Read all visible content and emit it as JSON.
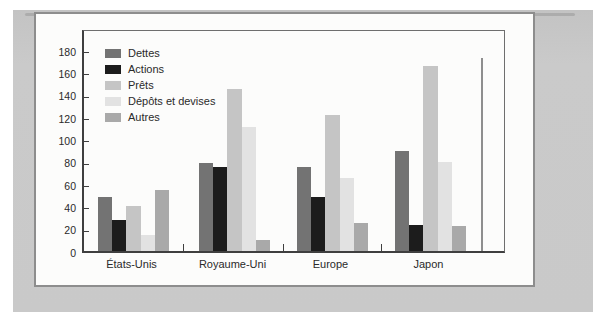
{
  "figure": {
    "unit_label": "%"
  },
  "chart_data": {
    "type": "bar",
    "title": "",
    "unit_label": "%",
    "categories": [
      "États-Unis",
      "Royaume-Uni",
      "Europe",
      "Japon"
    ],
    "series": [
      {
        "name": "Dettes",
        "color": "#737373",
        "values": [
          48,
          79,
          75,
          90
        ]
      },
      {
        "name": "Actions",
        "color": "#1c1c1c",
        "values": [
          28,
          75,
          48,
          23
        ]
      },
      {
        "name": "Prêts",
        "color": "#c5c5c5",
        "values": [
          40,
          145,
          122,
          166
        ]
      },
      {
        "name": "Dépôts et devises",
        "color": "#e2e2e2",
        "values": [
          14,
          111,
          65,
          80
        ]
      },
      {
        "name": "Autres",
        "color": "#a9a9a9",
        "values": [
          55,
          10,
          25,
          22
        ]
      }
    ],
    "ylabel": "%",
    "xlabel": "",
    "ylim": [
      0,
      180
    ],
    "ytick_step": 20,
    "yticks": [
      0,
      20,
      40,
      60,
      80,
      100,
      120,
      140,
      160,
      180
    ],
    "grid": false,
    "legend_position": "inside-top-left"
  }
}
